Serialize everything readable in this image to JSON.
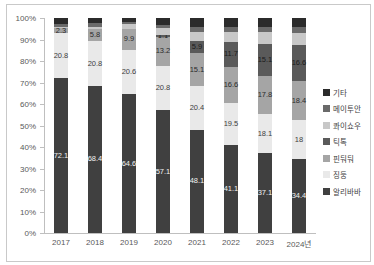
{
  "chart_data": {
    "type": "bar",
    "subtype": "stacked-100-percent",
    "title": "",
    "xlabel": "",
    "ylabel": "",
    "ylim": [
      0,
      100
    ],
    "grid": false,
    "legend_position": "right",
    "categories": [
      "2017",
      "2018",
      "2019",
      "2020",
      "2021",
      "2022",
      "2023",
      "2024년"
    ],
    "y_axis_ticks": [
      "100%",
      "90%",
      "80%",
      "70%",
      "60%",
      "50%",
      "40%",
      "30%",
      "20%",
      "10%",
      "0%"
    ],
    "series": [
      {
        "name": "알리바바",
        "color": "#404040",
        "label_color": "#f2f2f2",
        "values": [
          72.1,
          68.4,
          64.6,
          57.1,
          48.1,
          41.1,
          37.1,
          34.4
        ],
        "labels": [
          "72.1",
          "68.4",
          "64.6",
          "57.1",
          "48.1",
          "41.1",
          "37.1",
          "34.4"
        ]
      },
      {
        "name": "징둥",
        "color": "#e9e9e9",
        "label_color": "#404040",
        "values": [
          20.8,
          20.8,
          20.6,
          20.8,
          20.4,
          19.5,
          18.1,
          18
        ],
        "labels": [
          "20.8",
          "20.8",
          "20.6",
          "20.8",
          "20.4",
          "19.5",
          "18.1",
          "18"
        ]
      },
      {
        "name": "핀둬둬",
        "color": "#a5a5a5",
        "label_color": "#2b2b2b",
        "values": [
          2.3,
          5.8,
          9.9,
          13.2,
          15.1,
          16.6,
          17.8,
          18.4
        ],
        "labels": [
          "2.3",
          "5.8",
          "9.9",
          "13.2",
          "15.1",
          "16.6",
          "17.8",
          "18.4"
        ]
      },
      {
        "name": "틱톡",
        "color": "#5a5a5a",
        "label_color": "#1a1a1a",
        "values": [
          0,
          0,
          0,
          1.1,
          5.9,
          11.7,
          15.1,
          16.6
        ],
        "labels": [
          null,
          null,
          null,
          "1.1",
          "5.9",
          "11.7",
          "15.1",
          "16.6"
        ]
      },
      {
        "name": "콰이쇼우",
        "color": "#c8c8c8",
        "label_color": "#2b2b2b",
        "values": [
          0.4,
          1.0,
          1.9,
          3.0,
          4.0,
          4.7,
          5.3,
          5.6
        ],
        "labels": [
          null,
          null,
          null,
          null,
          null,
          null,
          null,
          null
        ]
      },
      {
        "name": "메이투안",
        "color": "#6a6a6a",
        "label_color": "#f2f2f2",
        "values": [
          1.4,
          1.5,
          1.0,
          1.8,
          2.5,
          2.4,
          2.6,
          3.0
        ],
        "labels": [
          null,
          null,
          null,
          null,
          null,
          null,
          null,
          null
        ]
      },
      {
        "name": "기타",
        "color": "#2b2b2b",
        "label_color": "#f2f2f2",
        "values": [
          3.0,
          2.5,
          2.0,
          3.0,
          4.0,
          4.0,
          4.0,
          4.0
        ],
        "labels": [
          null,
          null,
          null,
          null,
          null,
          null,
          null,
          null
        ]
      }
    ],
    "legend_order_top_to_bottom": [
      "기타",
      "메이투안",
      "콰이쇼우",
      "틱톡",
      "핀둬둬",
      "징둥",
      "알리바바"
    ]
  },
  "style": {
    "axis_line_color": "#bfbfbf",
    "axis_label_color": "#595959",
    "frame_border_color": "#c9c9c9",
    "background_color": "#ffffff"
  }
}
